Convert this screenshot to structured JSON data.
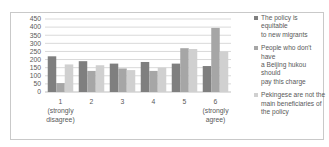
{
  "chart_data": {
    "type": "bar",
    "title": "",
    "xlabel": "",
    "ylabel": "",
    "ylim": [
      0,
      450
    ],
    "yticks": [
      0,
      50,
      100,
      150,
      200,
      250,
      300,
      350,
      400,
      450
    ],
    "grid": true,
    "legend_position": "right",
    "categories": [
      "1 (strongly disagree)",
      "2",
      "3",
      "4",
      "5",
      "6 (strongly agree)"
    ],
    "category_labels": [
      [
        "1",
        "(strongly",
        "disagree)"
      ],
      [
        "2"
      ],
      [
        "3"
      ],
      [
        "4"
      ],
      [
        "5"
      ],
      [
        "6",
        "(strongly",
        "agree)"
      ]
    ],
    "series": [
      {
        "name": "The policy is equitable to new migrants",
        "color": "#7f7f7f",
        "values": [
          220,
          190,
          175,
          185,
          175,
          160
        ]
      },
      {
        "name": "People who don't have a Beijing hukou should pay this charge",
        "color": "#a6a6a6",
        "values": [
          55,
          130,
          145,
          130,
          270,
          395
        ]
      },
      {
        "name": "Pekingese are not the main beneficiaries of the policy",
        "color": "#d0d0d0",
        "values": [
          170,
          165,
          135,
          150,
          265,
          250
        ]
      }
    ]
  },
  "legend": {
    "items": [
      {
        "lines": [
          "The policy is equitable",
          "to new migrants"
        ]
      },
      {
        "lines": [
          "People who don't have",
          "a Beijing hukou should",
          "pay this charge"
        ]
      },
      {
        "lines": [
          "Pekingese are not the",
          "main beneficiaries of",
          "the policy"
        ]
      }
    ]
  }
}
